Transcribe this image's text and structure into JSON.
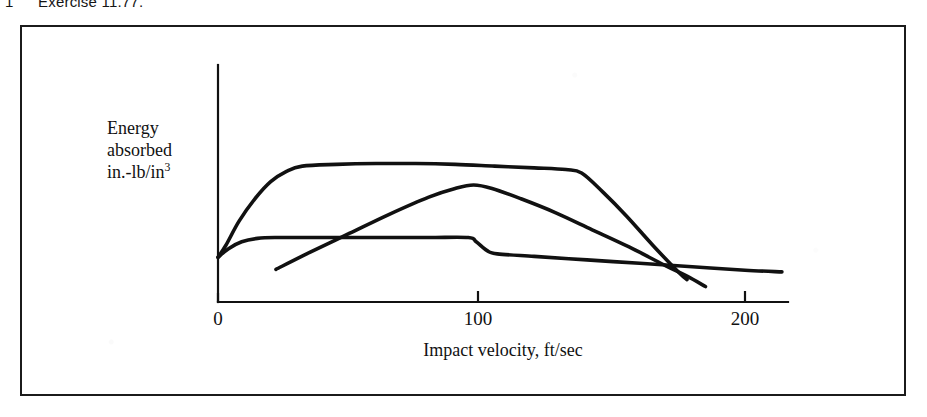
{
  "caption": {
    "number": "1",
    "text": "Exercise 11.77."
  },
  "figure": {
    "frame_color": "#1b1b1b",
    "background": "#ffffff",
    "ink_color": "#111111"
  },
  "axes": {
    "ylabel_line1": "Energy",
    "ylabel_line2": "absorbed",
    "ylabel_line3_base": "in.-lb/in",
    "ylabel_line3_sup": "3",
    "xlabel": "Impact velocity, ft/sec",
    "xticks": [
      "0",
      "100",
      "200"
    ]
  },
  "chart_data": {
    "type": "line",
    "title": "",
    "subtitle": "",
    "xlabel": "Impact velocity, ft/sec",
    "ylabel": "Energy absorbed in.-lb/in^3",
    "xlim": [
      0,
      214
    ],
    "ylim": [
      0,
      100
    ],
    "xticks": [
      0,
      100,
      200
    ],
    "yticks": [],
    "grid": false,
    "legend": false,
    "legend_position": "none",
    "annotations": [],
    "axis_style": "two-axis-L-with-open-right-end",
    "series": [
      {
        "name": "upper-plateau-curve",
        "comment": "rises steeply from origin region to a high broad plateau, holds to ~138 ft/sec, then falls steeply, ending above the axis near 178 ft/sec",
        "x": [
          0,
          3,
          8,
          14,
          20,
          26,
          32,
          45,
          60,
          75,
          90,
          105,
          120,
          132,
          138,
          146,
          155,
          165,
          175,
          178
        ],
        "y": [
          26,
          33,
          47,
          60,
          70,
          76,
          79,
          80,
          80.5,
          80.5,
          80,
          79,
          78,
          77,
          75,
          64,
          50,
          33,
          17,
          13
        ]
      },
      {
        "name": "rising-peak-curve",
        "comment": "straight rising line starting at ~22 ft/sec low on the plot, peaking near 97 ft/sec then falling steadily, crossing the other curves near 178 and ending lowest at ~185 ft/sec",
        "x": [
          22,
          35,
          50,
          65,
          80,
          90,
          97,
          104,
          115,
          128,
          142,
          156,
          170,
          178,
          185
        ],
        "y": [
          19,
          29,
          40,
          51,
          61,
          66,
          68,
          66,
          60,
          52,
          42,
          32,
          21,
          15,
          9
        ]
      },
      {
        "name": "low-plateau-step-curve",
        "comment": "rises quickly to a low plateau, holds flat to ~97 ft/sec, steps down, then declines gently to the right edge near 214 ft/sec",
        "x": [
          0,
          4,
          9,
          15,
          22,
          40,
          60,
          80,
          95,
          98,
          102,
          106,
          120,
          140,
          160,
          180,
          200,
          214
        ],
        "y": [
          26,
          31,
          35,
          37,
          37.5,
          37.5,
          37.5,
          37.5,
          37.5,
          35,
          30,
          28,
          26.5,
          24.5,
          22.5,
          20.5,
          18.5,
          17.5
        ]
      }
    ]
  }
}
